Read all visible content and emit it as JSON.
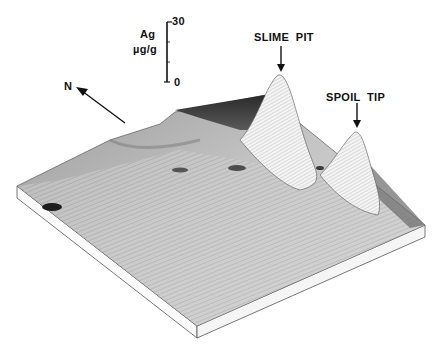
{
  "figure": {
    "type": "3d-surface-plot",
    "colors": {
      "ink": "#111111",
      "surface_light": "#e6e6e6",
      "surface_mid": "#a8a8a8",
      "surface_dark": "#3a3a3a",
      "background": "#ffffff"
    }
  },
  "scale_bar": {
    "element": "Ag",
    "unit": "µg/g",
    "max_label": "30",
    "min_label": "0",
    "max_value": 30,
    "min_value": 0
  },
  "north_arrow": {
    "label": "N"
  },
  "annotations": [
    {
      "id": "slime-pit",
      "label": "SLIME  PIT"
    },
    {
      "id": "spoil-tip",
      "label": "SPOIL  TIP"
    }
  ]
}
